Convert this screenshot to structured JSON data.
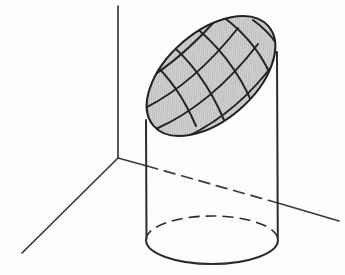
{
  "figure": {
    "title": "Oblique plane section of a right circular cylinder",
    "canvas": {
      "width": 345,
      "height": 275
    },
    "colors": {
      "background": "#fdfdfd",
      "ink": "#2b2b2b",
      "axis": "#3a3a3a",
      "ellipse_fill": "#c9c9c9",
      "mesh_line": "#242424",
      "hidden_line": "#3a3a3a"
    },
    "stroke_widths": {
      "outline": 2.0,
      "mesh": 2.0,
      "axis": 1.7,
      "hidden": 1.6
    },
    "dash_patterns": {
      "base_back_arc": "11,6",
      "y_axis_hidden": "11,7"
    }
  },
  "axes": {
    "origin": {
      "x": 118,
      "y": 158
    },
    "items": [
      {
        "name": "z-axis",
        "label": "",
        "direction": "vertical-up",
        "start": {
          "x": 118,
          "y": 158
        },
        "end": {
          "x": 118,
          "y": 6
        },
        "style": "solid"
      },
      {
        "name": "x-axis",
        "label": "",
        "direction": "lower-left",
        "start": {
          "x": 118,
          "y": 158
        },
        "end": {
          "x": 22,
          "y": 253
        },
        "style": "solid"
      },
      {
        "name": "y-axis-visible-near",
        "label": "",
        "direction": "right-down",
        "start": {
          "x": 118,
          "y": 158
        },
        "end": {
          "x": 147,
          "y": 166
        },
        "style": "solid"
      },
      {
        "name": "y-axis-hidden",
        "label": "",
        "direction": "right-down",
        "start": {
          "x": 147,
          "y": 166
        },
        "end": {
          "x": 278,
          "y": 203
        },
        "style": "dashed"
      },
      {
        "name": "y-axis-visible-far",
        "label": "",
        "direction": "right-down",
        "start": {
          "x": 278,
          "y": 203
        },
        "end": {
          "x": 339,
          "y": 221
        },
        "style": "solid"
      }
    ]
  },
  "cylinder": {
    "left_wall": {
      "top": {
        "x": 146,
        "y": 120
      },
      "bottom": {
        "x": 147,
        "y": 239
      }
    },
    "right_wall": {
      "top": {
        "x": 277,
        "y": 52
      },
      "bottom": {
        "x": 278,
        "y": 240
      }
    },
    "base_ellipse": {
      "center": {
        "x": 212,
        "y": 240
      },
      "rx": 66,
      "ry": 24,
      "front_arc_style": "solid",
      "back_arc_style": "dashed"
    }
  },
  "section_ellipse": {
    "center": {
      "x": 211,
      "y": 76
    },
    "semi_major": 76,
    "semi_minor": 44,
    "rotation_deg": -41,
    "fill": "#c9c9c9",
    "outline": "#222222",
    "mesh": {
      "family_a_count": 5,
      "family_b_count": 5,
      "description": "two transverse families of gently curved lines forming a quadrilateral grid across the shaded ellipse"
    }
  }
}
